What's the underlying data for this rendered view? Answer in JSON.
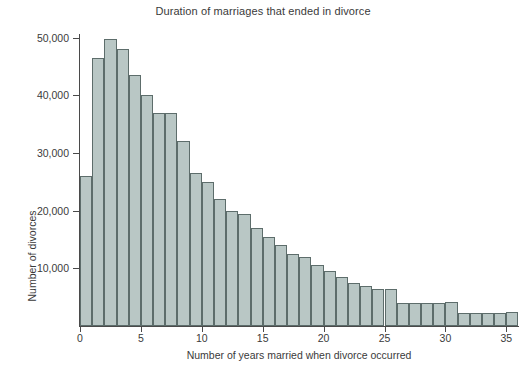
{
  "chart_data": {
    "type": "bar",
    "title": "Duration of marriages that ended in divorce",
    "xlabel": "Number of years married when divorce occurred",
    "ylabel": "Number of divorces",
    "xlim": [
      0,
      36
    ],
    "ylim": [
      0,
      52000
    ],
    "grid": false,
    "legend": false,
    "bar_width_years": 1,
    "xticks": [
      0,
      5,
      10,
      15,
      20,
      25,
      30,
      35
    ],
    "xtick_labels": [
      "0",
      "5",
      "10",
      "15",
      "20",
      "25",
      "30",
      "35"
    ],
    "yticks": [
      10000,
      20000,
      30000,
      40000,
      50000
    ],
    "ytick_labels": [
      "10,000",
      "20,000",
      "30,000",
      "40,000",
      "50,000"
    ],
    "bar_fill_color": "#b9c7c5",
    "bar_edge_color": "#5d6d6b",
    "axis_color": "#4a4a4a",
    "text_color": "#3a3a3a",
    "categories": [
      0,
      1,
      2,
      3,
      4,
      5,
      6,
      7,
      8,
      9,
      10,
      11,
      12,
      13,
      14,
      15,
      16,
      17,
      18,
      19,
      20,
      21,
      22,
      23,
      24,
      25,
      26,
      27,
      28,
      29,
      30,
      31,
      32,
      33,
      34,
      35
    ],
    "values": [
      26000,
      46500,
      49800,
      48000,
      43500,
      40000,
      37000,
      37000,
      32000,
      26500,
      25000,
      22000,
      20000,
      19500,
      17000,
      15500,
      14000,
      12500,
      12000,
      10500,
      9500,
      8500,
      7500,
      7000,
      6500,
      6500,
      4000,
      4000,
      4000,
      4000,
      4200,
      2300,
      2300,
      2300,
      2300,
      2500
    ]
  }
}
